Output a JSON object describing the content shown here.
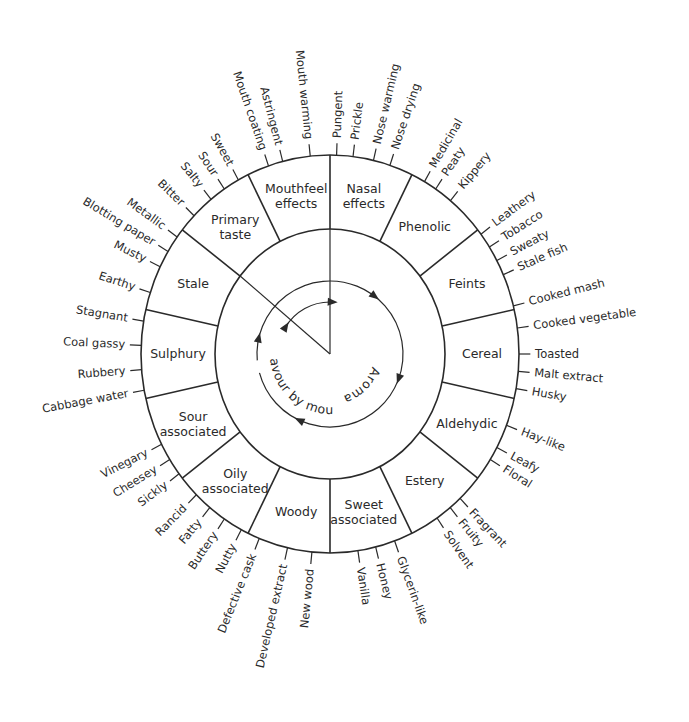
{
  "diagram": {
    "type": "flavour-wheel",
    "colors": {
      "background": "#ffffff",
      "inner_disc": "#ececec",
      "ring": "#fafafa",
      "line": "#2a2a2a",
      "text": "#2a2a2a"
    },
    "center_labels": {
      "aroma": "Aroma",
      "flavour_by_mouth": "Flavour by mouth"
    },
    "segments": [
      {
        "id": "mouthfeel-effects",
        "lines": [
          "Mouthfeel",
          "effects"
        ],
        "start": 334.3,
        "end": 360,
        "descriptors": [
          {
            "label": "Mouth coating",
            "angle": 341
          },
          {
            "label": "Astringent",
            "angle": 345.5
          },
          {
            "label": "Mouth warming",
            "angle": 354
          }
        ]
      },
      {
        "id": "nasal-effects",
        "lines": [
          "Nasal",
          "effects"
        ],
        "start": 0,
        "end": 25.7,
        "descriptors": [
          {
            "label": "Pungent",
            "angle": 2
          },
          {
            "label": "Prickle",
            "angle": 7
          },
          {
            "label": "Nose warming",
            "angle": 13.3
          },
          {
            "label": "Nose drying",
            "angle": 18.5
          }
        ]
      },
      {
        "id": "phenolic",
        "lines": [
          "Phenolic"
        ],
        "start": 25.7,
        "end": 51.4,
        "descriptors": [
          {
            "label": "Medicinal",
            "angle": 30
          },
          {
            "label": "Peaty",
            "angle": 34
          },
          {
            "label": "Kippery",
            "angle": 39.6
          }
        ]
      },
      {
        "id": "feints",
        "lines": [
          "Feints"
        ],
        "start": 51.4,
        "end": 77.1,
        "descriptors": [
          {
            "label": "Leathery",
            "angle": 53
          },
          {
            "label": "Tobacco",
            "angle": 57.5
          },
          {
            "label": "Sweaty",
            "angle": 62
          },
          {
            "label": "Stale fish",
            "angle": 66.5
          }
        ]
      },
      {
        "id": "cereal",
        "lines": [
          "Cereal"
        ],
        "start": 77.1,
        "end": 102.9,
        "descriptors": [
          {
            "label": "Cooked mash",
            "angle": 76
          },
          {
            "label": "Cooked vegetable",
            "angle": 82.5
          },
          {
            "label": "Toasted",
            "angle": 90
          },
          {
            "label": "Malt extract",
            "angle": 95
          },
          {
            "label": "Husky",
            "angle": 100
          }
        ]
      },
      {
        "id": "aldehydic",
        "lines": [
          "Aldehydic"
        ],
        "start": 102.9,
        "end": 128.6,
        "descriptors": [
          {
            "label": "Hay-like",
            "angle": 111
          },
          {
            "label": "Leafy",
            "angle": 118
          },
          {
            "label": "Floral",
            "angle": 122
          }
        ]
      },
      {
        "id": "estery",
        "lines": [
          "Estery"
        ],
        "start": 128.6,
        "end": 154.3,
        "descriptors": [
          {
            "label": "Fragrant",
            "angle": 136.5
          },
          {
            "label": "Fruity",
            "angle": 140.5
          },
          {
            "label": "Solvent",
            "angle": 145.5
          }
        ]
      },
      {
        "id": "sweet-associated",
        "lines": [
          "Sweet",
          "associated"
        ],
        "start": 154.3,
        "end": 180,
        "descriptors": [
          {
            "label": "Glycerin-like",
            "angle": 160
          },
          {
            "label": "Honey",
            "angle": 166
          },
          {
            "label": "Vanilla",
            "angle": 171.5
          }
        ]
      },
      {
        "id": "woody",
        "lines": [
          "Woody"
        ],
        "start": 180,
        "end": 205.7,
        "descriptors": [
          {
            "label": "New wood",
            "angle": 185.5
          },
          {
            "label": "Developed extract",
            "angle": 193
          },
          {
            "label": "Defective cask",
            "angle": 202
          }
        ]
      },
      {
        "id": "oily-associated",
        "lines": [
          "Oily",
          "associated"
        ],
        "start": 205.7,
        "end": 231.4,
        "descriptors": [
          {
            "label": "Nutty",
            "angle": 208
          },
          {
            "label": "Buttery",
            "angle": 214
          },
          {
            "label": "Fatty",
            "angle": 219.5
          },
          {
            "label": "Rancid",
            "angle": 225
          }
        ]
      },
      {
        "id": "sour-associated",
        "lines": [
          "Sour",
          "associated"
        ],
        "start": 231.4,
        "end": 257.1,
        "descriptors": [
          {
            "label": "Sickly",
            "angle": 233
          },
          {
            "label": "Cheesey",
            "angle": 238
          },
          {
            "label": "Vinegary",
            "angle": 243
          }
        ]
      },
      {
        "id": "sulphury",
        "lines": [
          "Sulphury"
        ],
        "start": 257.1,
        "end": 282.9,
        "descriptors": [
          {
            "label": "Cabbage water",
            "angle": 259.5
          },
          {
            "label": "Rubbery",
            "angle": 265.5
          },
          {
            "label": "Coal gassy",
            "angle": 272.5
          },
          {
            "label": "Stagnant",
            "angle": 279.5
          }
        ]
      },
      {
        "id": "stale",
        "lines": [
          "Stale"
        ],
        "start": 282.9,
        "end": 308.6,
        "descriptors": [
          {
            "label": "Earthy",
            "angle": 288
          },
          {
            "label": "Musty",
            "angle": 296
          },
          {
            "label": "Blotting paper",
            "angle": 301
          },
          {
            "label": "Metallic",
            "angle": 306
          }
        ]
      },
      {
        "id": "primary-taste",
        "lines": [
          "Primary",
          "taste"
        ],
        "start": 308.6,
        "end": 334.3,
        "descriptors": [
          {
            "label": "Bitter",
            "angle": 314
          },
          {
            "label": "Salty",
            "angle": 321
          },
          {
            "label": "Sour",
            "angle": 326
          },
          {
            "label": "Sweet",
            "angle": 331
          }
        ]
      }
    ]
  }
}
